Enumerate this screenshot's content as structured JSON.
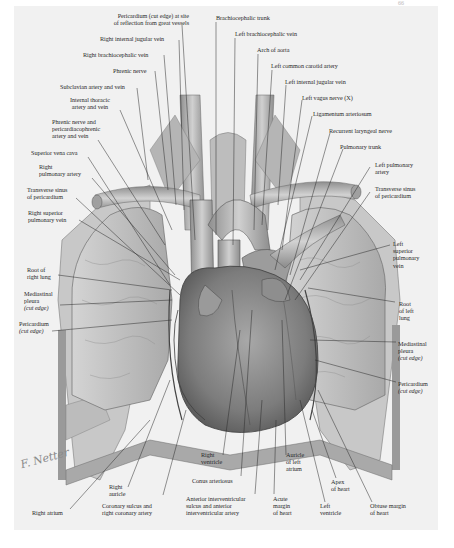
{
  "figure": {
    "page_number": "66",
    "signature": "F. Netter",
    "palette": {
      "paper": "#f1f1f1",
      "ink": "#2a2a2a",
      "tissue_light": "#b9b9b9",
      "tissue_mid": "#8c8c8c",
      "tissue_dark": "#5e5e5e"
    }
  },
  "labels": {
    "pericardium_top": "Pericardium (cut edge) at site",
    "pericardium_top_2": "of reflection from great vessels",
    "right_internal_jugular": "Right internal jugular vein",
    "right_brachiocephalic": "Right brachiocephalic vein",
    "phrenic_nerve": "Phrenic nerve",
    "subclavian": "Subclavian artery and vein",
    "internal_thoracic_1": "Internal thoracic",
    "internal_thoracic_2": "artery and vein",
    "phrenic_pericardiaco_1": "Phrenic nerve and",
    "phrenic_pericardiaco_2": "pericardiacophrenic",
    "phrenic_pericardiaco_3": "artery and vein",
    "svc": "Superior vena cava",
    "right_pulm_artery_1": "Right",
    "right_pulm_artery_2": "pulmonary artery",
    "transverse_sinus_r_1": "Transverse sinus",
    "transverse_sinus_r_2": "of pericardium",
    "right_sup_pulm_vein_1": "Right superior",
    "right_sup_pulm_vein_2": "pulmonary vein",
    "root_right_lung_1": "Root of",
    "root_right_lung_2": "right lung",
    "mediastinal_pleura_r_1": "Mediastinal",
    "mediastinal_pleura_r_2": "pleura",
    "mediastinal_pleura_r_3": "(cut edge)",
    "pericardium_r_1": "Pericardium",
    "pericardium_r_2": "(cut edge)",
    "brachiocephalic_trunk": "Brachiocephalic trunk",
    "left_brachiocephalic": "Left brachiocephalic vein",
    "arch_aorta": "Arch of aorta",
    "left_common_carotid": "Left common carotid artery",
    "left_internal_jugular": "Left internal jugular vein",
    "left_vagus": "Left vagus nerve (X)",
    "ligamentum": "Ligamentum arteriosum",
    "recurrent_laryngeal": "Recurrent laryngeal nerve",
    "pulmonary_trunk": "Pulmonary trunk",
    "left_pulm_artery_1": "Left pulmonary",
    "left_pulm_artery_2": "artery",
    "transverse_sinus_l_1": "Transverse sinus",
    "transverse_sinus_l_2": "of pericardium",
    "left_sup_pulm_vein_1": "Left",
    "left_sup_pulm_vein_2": "superior",
    "left_sup_pulm_vein_3": "pulmonary",
    "left_sup_pulm_vein_4": "vein",
    "root_left_lung_1": "Root",
    "root_left_lung_2": "of left",
    "root_left_lung_3": "lung",
    "mediastinal_pleura_l_1": "Mediastinal",
    "mediastinal_pleura_l_2": "pleura",
    "mediastinal_pleura_l_3": "(cut edge)",
    "pericardium_l_1": "Pericardium",
    "pericardium_l_2": "(cut edge)",
    "right_atrium": "Right atrium",
    "right_auricle_1": "Right",
    "right_auricle_2": "auricle",
    "coronary_sulcus_1": "Coronary sulcus and",
    "coronary_sulcus_2": "right coronary artery",
    "right_ventricle_1": "Right",
    "right_ventricle_2": "ventricle",
    "conus": "Conus arteriosus",
    "anterior_iv_1": "Anterior interventricular",
    "anterior_iv_2": "sulcus and anterior",
    "anterior_iv_3": "interventricular artery",
    "acute_margin_1": "Acute",
    "acute_margin_2": "margin",
    "acute_margin_3": "of heart",
    "auricle_left_1": "Auricle",
    "auricle_left_2": "of left",
    "auricle_left_3": "atrium",
    "apex_1": "Apex",
    "apex_2": "of heart",
    "left_ventricle_1": "Left",
    "left_ventricle_2": "ventricle",
    "obtuse_1": "Obtuse margin",
    "obtuse_2": "of heart"
  }
}
